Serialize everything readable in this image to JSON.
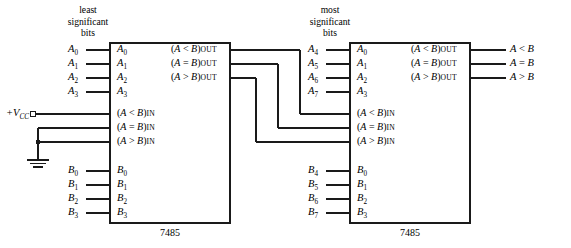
{
  "diagram": {
    "line_color": "#1a1a1a",
    "text_color": "#000000",
    "background": "#ffffff"
  },
  "captions": {
    "least_significant": [
      "least",
      "significant",
      "bits"
    ],
    "most_significant": [
      "most",
      "significant",
      "bits"
    ]
  },
  "power": {
    "vcc_label": "+V",
    "vcc_sub": "CC",
    "terminal_icon": "open-circle-terminal",
    "ground_icon": "ground-symbol"
  },
  "chips": [
    {
      "id": "lsb-chip",
      "part_number": "7485",
      "external_a_inputs": [
        {
          "name": "A",
          "sub": "0"
        },
        {
          "name": "A",
          "sub": "1"
        },
        {
          "name": "A",
          "sub": "2"
        },
        {
          "name": "A",
          "sub": "3"
        }
      ],
      "internal_a_pins": [
        {
          "name": "A",
          "sub": "0"
        },
        {
          "name": "A",
          "sub": "1"
        },
        {
          "name": "A",
          "sub": "2"
        },
        {
          "name": "A",
          "sub": "3"
        }
      ],
      "external_b_inputs": [
        {
          "name": "B",
          "sub": "0"
        },
        {
          "name": "B",
          "sub": "1"
        },
        {
          "name": "B",
          "sub": "2"
        },
        {
          "name": "B",
          "sub": "3"
        }
      ],
      "internal_b_pins": [
        {
          "name": "B",
          "sub": "0"
        },
        {
          "name": "B",
          "sub": "1"
        },
        {
          "name": "B",
          "sub": "2"
        },
        {
          "name": "B",
          "sub": "3"
        }
      ],
      "cascade_inputs": [
        {
          "open": "(",
          "a": "A",
          "op": "<",
          "b": "B",
          "close": ")",
          "suffix": "IN"
        },
        {
          "open": "(",
          "a": "A",
          "op": "=",
          "b": "B",
          "close": ")",
          "suffix": "IN"
        },
        {
          "open": "(",
          "a": "A",
          "op": ">",
          "b": "B",
          "close": ")",
          "suffix": "IN"
        }
      ],
      "cascade_outputs": [
        {
          "open": "(",
          "a": "A",
          "op": "<",
          "b": "B",
          "close": ")",
          "suffix": "OUT"
        },
        {
          "open": "(",
          "a": "A",
          "op": "=",
          "b": "B",
          "close": ")",
          "suffix": "OUT"
        },
        {
          "open": "(",
          "a": "A",
          "op": ">",
          "b": "B",
          "close": ")",
          "suffix": "OUT"
        }
      ]
    },
    {
      "id": "msb-chip",
      "part_number": "7485",
      "external_a_inputs": [
        {
          "name": "A",
          "sub": "4"
        },
        {
          "name": "A",
          "sub": "5"
        },
        {
          "name": "A",
          "sub": "6"
        },
        {
          "name": "A",
          "sub": "7"
        }
      ],
      "internal_a_pins": [
        {
          "name": "A",
          "sub": "0"
        },
        {
          "name": "A",
          "sub": "1"
        },
        {
          "name": "A",
          "sub": "2"
        },
        {
          "name": "A",
          "sub": "3"
        }
      ],
      "external_b_inputs": [
        {
          "name": "B",
          "sub": "4"
        },
        {
          "name": "B",
          "sub": "5"
        },
        {
          "name": "B",
          "sub": "6"
        },
        {
          "name": "B",
          "sub": "7"
        }
      ],
      "internal_b_pins": [
        {
          "name": "B",
          "sub": "0"
        },
        {
          "name": "B",
          "sub": "1"
        },
        {
          "name": "B",
          "sub": "2"
        },
        {
          "name": "B",
          "sub": "3"
        }
      ],
      "cascade_inputs": [
        {
          "open": "(",
          "a": "A",
          "op": "<",
          "b": "B",
          "close": ")",
          "suffix": "IN"
        },
        {
          "open": "(",
          "a": "A",
          "op": "=",
          "b": "B",
          "close": ")",
          "suffix": "IN"
        },
        {
          "open": "(",
          "a": "A",
          "op": ">",
          "b": "B",
          "close": ")",
          "suffix": "IN"
        }
      ],
      "cascade_outputs": [
        {
          "open": "(",
          "a": "A",
          "op": "<",
          "b": "B",
          "close": ")",
          "suffix": "OUT"
        },
        {
          "open": "(",
          "a": "A",
          "op": "=",
          "b": "B",
          "close": ")",
          "suffix": "OUT"
        },
        {
          "open": "(",
          "a": "A",
          "op": ">",
          "b": "B",
          "close": ")",
          "suffix": "OUT"
        }
      ]
    }
  ],
  "final_outputs": [
    {
      "a": "A",
      "op": "<",
      "b": "B"
    },
    {
      "a": "A",
      "op": "=",
      "b": "B"
    },
    {
      "a": "A",
      "op": ">",
      "b": "B"
    }
  ]
}
